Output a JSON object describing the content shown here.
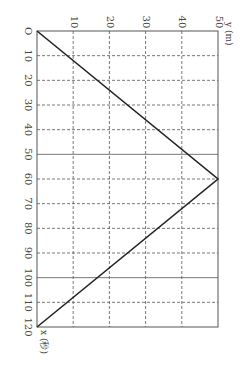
{
  "chart_data": {
    "type": "line",
    "title": "",
    "orientation": "rotated 90 degrees clockwise (time axis runs downward, distance axis runs rightward)",
    "xlabel": "x (秒)",
    "ylabel": "y (m)",
    "origin_label": "O",
    "xlim": [
      0,
      120
    ],
    "ylim": [
      0,
      50
    ],
    "x_ticks": [
      "10",
      "20",
      "30",
      "40",
      "50",
      "60",
      "70",
      "80",
      "90",
      "100",
      "110",
      "120"
    ],
    "y_ticks": [
      "10",
      "20",
      "30",
      "40",
      "50"
    ],
    "grid": "dashed, with solid lines at x=50 and x=100",
    "series": [
      {
        "name": "y vs x",
        "x": [
          0,
          60,
          120
        ],
        "y": [
          0,
          50,
          0
        ]
      }
    ],
    "colors": {
      "line": "#222222",
      "grid": "#555555",
      "frame": "#555555"
    }
  }
}
